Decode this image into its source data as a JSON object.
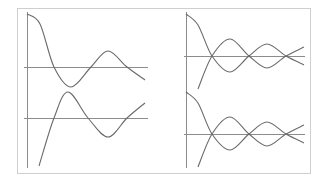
{
  "figure": {
    "frame": {
      "x": 17,
      "y": 8,
      "width": 293,
      "height": 165,
      "color": "#cfcfcf"
    },
    "curve_color": "#6a6a6a",
    "axis_color": "#8c8c8c"
  },
  "chart_data": [
    {
      "type": "line",
      "title": "",
      "xlabel": "",
      "ylabel": "",
      "grid": false,
      "legend": null,
      "panel": "left-top",
      "y_axis": {
        "x": 27,
        "y1": 12,
        "y2": 168
      },
      "x_axis": {
        "y": 67,
        "x1": 24,
        "x2": 148
      },
      "series": [
        {
          "name": "curve-1",
          "points": [
            [
              27,
              14
            ],
            [
              40,
              24
            ],
            [
              54,
              67
            ],
            [
              71,
              87
            ],
            [
              91,
              67
            ],
            [
              108,
              51
            ],
            [
              127,
              67
            ],
            [
              145,
              80
            ]
          ]
        }
      ]
    },
    {
      "type": "line",
      "title": "",
      "xlabel": "",
      "ylabel": "",
      "grid": false,
      "legend": null,
      "panel": "left-bottom",
      "x_axis": {
        "y": 118,
        "x1": 24,
        "x2": 148
      },
      "series": [
        {
          "name": "curve-2",
          "points": [
            [
              39,
              166
            ],
            [
              54,
              118
            ],
            [
              68,
              92
            ],
            [
              88,
              118
            ],
            [
              108,
              137
            ],
            [
              127,
              118
            ],
            [
              145,
              103
            ]
          ]
        }
      ]
    },
    {
      "type": "line",
      "title": "",
      "xlabel": "",
      "ylabel": "",
      "grid": false,
      "legend": null,
      "panel": "right-top",
      "y_axis": {
        "x": 186,
        "y1": 12,
        "y2": 168
      },
      "x_axis": {
        "y": 56,
        "x1": 184,
        "x2": 305
      },
      "series": [
        {
          "name": "upper",
          "points": [
            [
              186,
              14
            ],
            [
              198,
              25
            ],
            [
              212,
              56
            ],
            [
              230,
              72
            ],
            [
              249,
              56
            ],
            [
              267,
              44
            ],
            [
              286,
              56
            ],
            [
              304,
              65
            ]
          ]
        },
        {
          "name": "lower",
          "points": [
            [
              198,
              89
            ],
            [
              212,
              56
            ],
            [
              230,
              39
            ],
            [
              249,
              56
            ],
            [
              267,
              68
            ],
            [
              286,
              56
            ],
            [
              304,
              47
            ]
          ]
        }
      ]
    },
    {
      "type": "line",
      "title": "",
      "xlabel": "",
      "ylabel": "",
      "grid": false,
      "legend": null,
      "panel": "right-bottom",
      "x_axis": {
        "y": 134,
        "x1": 184,
        "x2": 305
      },
      "series": [
        {
          "name": "upper",
          "points": [
            [
              186,
              92
            ],
            [
              198,
              103
            ],
            [
              212,
              134
            ],
            [
              230,
              150
            ],
            [
              249,
              134
            ],
            [
              267,
              122
            ],
            [
              286,
              134
            ],
            [
              304,
              143
            ]
          ]
        },
        {
          "name": "lower",
          "points": [
            [
              198,
              167
            ],
            [
              212,
              134
            ],
            [
              230,
              117
            ],
            [
              249,
              134
            ],
            [
              267,
              146
            ],
            [
              286,
              134
            ],
            [
              304,
              125
            ]
          ]
        }
      ]
    }
  ]
}
